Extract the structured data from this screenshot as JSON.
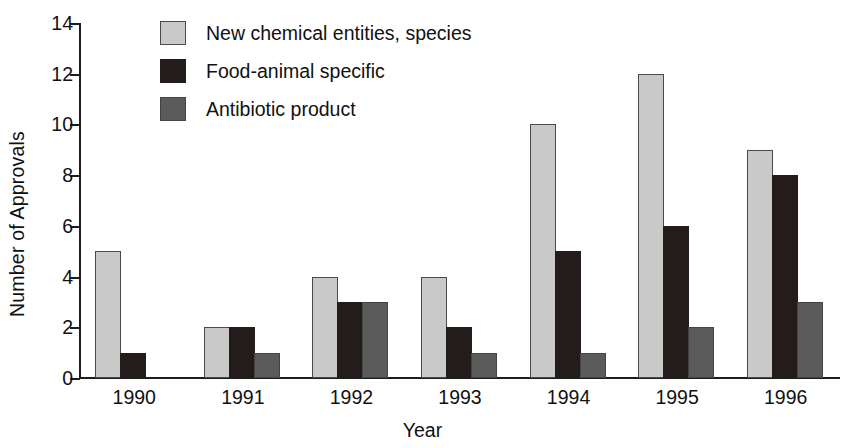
{
  "chart_data": {
    "type": "bar",
    "title": "",
    "xlabel": "Year",
    "ylabel": "Number of Approvals",
    "categories": [
      "1990",
      "1991",
      "1992",
      "1993",
      "1994",
      "1995",
      "1996"
    ],
    "series": [
      {
        "name": "New chemical entities, species",
        "color": "#c9c9c9",
        "values": [
          5,
          2,
          4,
          4,
          10,
          12,
          9
        ]
      },
      {
        "name": "Food-animal specific",
        "color": "#241b1b",
        "values": [
          1,
          2,
          3,
          2,
          5,
          6,
          8
        ]
      },
      {
        "name": "Antibiotic product",
        "color": "#5b5b5b",
        "values": [
          0,
          1,
          3,
          1,
          1,
          2,
          3
        ]
      }
    ],
    "ylim": [
      0,
      14
    ],
    "yticks": [
      0,
      2,
      4,
      6,
      8,
      10,
      12,
      14
    ],
    "grid": false,
    "legend_position": "top-left-inside"
  }
}
